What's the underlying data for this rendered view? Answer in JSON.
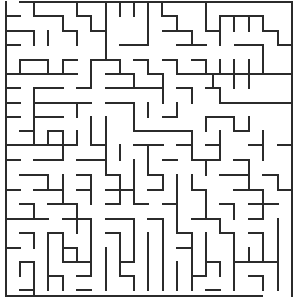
{
  "maze": {
    "width": 302,
    "height": 300,
    "wall_color": "#2b2b2b",
    "background": "#ffffff",
    "grid": {
      "cols": 20,
      "rows": 20,
      "origin_x": 6,
      "origin_y": 2,
      "cell": 14.4
    },
    "walls": [
      [
        20,
        2,
        292,
        2
      ],
      [
        6,
        2,
        6,
        296
      ],
      [
        292,
        2,
        292,
        296
      ],
      [
        6,
        296,
        262,
        296
      ],
      [
        6,
        16,
        20,
        16
      ],
      [
        34,
        2,
        34,
        16
      ],
      [
        34,
        16,
        63,
        16
      ],
      [
        63,
        16,
        63,
        31
      ],
      [
        77,
        2,
        77,
        16
      ],
      [
        77,
        16,
        91,
        16
      ],
      [
        91,
        16,
        91,
        31
      ],
      [
        106,
        2,
        106,
        31
      ],
      [
        120,
        2,
        120,
        16
      ],
      [
        134,
        2,
        134,
        16
      ],
      [
        148,
        2,
        148,
        31
      ],
      [
        162,
        2,
        162,
        16
      ],
      [
        163,
        16,
        177,
        16
      ],
      [
        177,
        16,
        177,
        31
      ],
      [
        206,
        2,
        206,
        31
      ],
      [
        220,
        16,
        263,
        16
      ],
      [
        220,
        16,
        220,
        45
      ],
      [
        234,
        16,
        234,
        31
      ],
      [
        249,
        16,
        249,
        31
      ],
      [
        263,
        16,
        263,
        31
      ],
      [
        263,
        31,
        278,
        31
      ],
      [
        278,
        31,
        278,
        45
      ],
      [
        278,
        45,
        292,
        45
      ],
      [
        6,
        31,
        34,
        31
      ],
      [
        34,
        31,
        34,
        45
      ],
      [
        48,
        31,
        48,
        45
      ],
      [
        63,
        31,
        77,
        31
      ],
      [
        77,
        31,
        77,
        45
      ],
      [
        91,
        31,
        106,
        31
      ],
      [
        106,
        31,
        106,
        45
      ],
      [
        148,
        31,
        148,
        45
      ],
      [
        134,
        45,
        148,
        45
      ],
      [
        163,
        31,
        192,
        31
      ],
      [
        192,
        31,
        192,
        45
      ],
      [
        177,
        45,
        206,
        45
      ],
      [
        206,
        31,
        220,
        31
      ],
      [
        235,
        45,
        263,
        45
      ],
      [
        263,
        45,
        263,
        60
      ],
      [
        6,
        45,
        20,
        45
      ],
      [
        106,
        45,
        106,
        60
      ],
      [
        120,
        45,
        134,
        45
      ],
      [
        20,
        60,
        48,
        60
      ],
      [
        20,
        60,
        20,
        74
      ],
      [
        48,
        60,
        48,
        74
      ],
      [
        63,
        60,
        77,
        60
      ],
      [
        63,
        60,
        63,
        74
      ],
      [
        91,
        60,
        120,
        60
      ],
      [
        91,
        60,
        91,
        88
      ],
      [
        120,
        60,
        120,
        74
      ],
      [
        134,
        60,
        148,
        60
      ],
      [
        148,
        60,
        148,
        74
      ],
      [
        163,
        60,
        177,
        60
      ],
      [
        177,
        60,
        177,
        74
      ],
      [
        192,
        60,
        206,
        60
      ],
      [
        206,
        60,
        206,
        74
      ],
      [
        220,
        60,
        220,
        74
      ],
      [
        234,
        60,
        234,
        74
      ],
      [
        249,
        60,
        249,
        74
      ],
      [
        263,
        60,
        263,
        74
      ],
      [
        6,
        74,
        77,
        74
      ],
      [
        106,
        74,
        134,
        74
      ],
      [
        134,
        74,
        134,
        88
      ],
      [
        148,
        74,
        163,
        74
      ],
      [
        163,
        74,
        163,
        88
      ],
      [
        177,
        74,
        292,
        74
      ],
      [
        213,
        74,
        213,
        88
      ],
      [
        234,
        74,
        234,
        88
      ],
      [
        249,
        74,
        249,
        88
      ],
      [
        6,
        88,
        20,
        88
      ],
      [
        34,
        88,
        63,
        88
      ],
      [
        34,
        88,
        34,
        145
      ],
      [
        77,
        88,
        91,
        88
      ],
      [
        106,
        88,
        163,
        88
      ],
      [
        163,
        88,
        163,
        103
      ],
      [
        177,
        88,
        192,
        88
      ],
      [
        192,
        88,
        192,
        103
      ],
      [
        206,
        88,
        220,
        88
      ],
      [
        220,
        88,
        220,
        103
      ],
      [
        6,
        103,
        20,
        103
      ],
      [
        34,
        103,
        91,
        103
      ],
      [
        77,
        103,
        77,
        117
      ],
      [
        106,
        103,
        134,
        103
      ],
      [
        134,
        103,
        134,
        131
      ],
      [
        134,
        131,
        177,
        131
      ],
      [
        148,
        103,
        148,
        117
      ],
      [
        177,
        103,
        177,
        117
      ],
      [
        163,
        117,
        177,
        117
      ],
      [
        220,
        103,
        292,
        103
      ],
      [
        6,
        117,
        20,
        117
      ],
      [
        34,
        117,
        63,
        117
      ],
      [
        91,
        117,
        91,
        145
      ],
      [
        106,
        117,
        106,
        131
      ],
      [
        163,
        131,
        192,
        131
      ],
      [
        206,
        117,
        234,
        117
      ],
      [
        206,
        117,
        206,
        131
      ],
      [
        234,
        117,
        234,
        131
      ],
      [
        249,
        117,
        249,
        131
      ],
      [
        20,
        131,
        34,
        131
      ],
      [
        48,
        131,
        63,
        131
      ],
      [
        48,
        131,
        48,
        145
      ],
      [
        63,
        131,
        63,
        160
      ],
      [
        77,
        131,
        77,
        145
      ],
      [
        106,
        131,
        106,
        145
      ],
      [
        192,
        131,
        192,
        160
      ],
      [
        220,
        131,
        220,
        145
      ],
      [
        234,
        131,
        249,
        131
      ],
      [
        263,
        131,
        263,
        145
      ],
      [
        6,
        145,
        63,
        145
      ],
      [
        63,
        145,
        77,
        145
      ],
      [
        91,
        145,
        106,
        145
      ],
      [
        106,
        145,
        106,
        175
      ],
      [
        120,
        145,
        120,
        160
      ],
      [
        134,
        145,
        163,
        145
      ],
      [
        148,
        145,
        148,
        175
      ],
      [
        177,
        145,
        192,
        145
      ],
      [
        206,
        145,
        220,
        145
      ],
      [
        220,
        145,
        220,
        160
      ],
      [
        249,
        145,
        263,
        145
      ],
      [
        263,
        145,
        263,
        160
      ],
      [
        278,
        145,
        292,
        145
      ],
      [
        6,
        160,
        20,
        160
      ],
      [
        34,
        160,
        63,
        160
      ],
      [
        77,
        160,
        106,
        160
      ],
      [
        134,
        160,
        134,
        190
      ],
      [
        163,
        160,
        177,
        160
      ],
      [
        192,
        160,
        220,
        160
      ],
      [
        206,
        160,
        206,
        175
      ],
      [
        234,
        160,
        249,
        160
      ],
      [
        249,
        160,
        249,
        175
      ],
      [
        20,
        175,
        48,
        175
      ],
      [
        48,
        175,
        48,
        190
      ],
      [
        63,
        175,
        63,
        204
      ],
      [
        77,
        175,
        91,
        175
      ],
      [
        91,
        175,
        91,
        204
      ],
      [
        106,
        175,
        120,
        175
      ],
      [
        120,
        175,
        120,
        204
      ],
      [
        148,
        175,
        163,
        175
      ],
      [
        163,
        175,
        163,
        190
      ],
      [
        177,
        175,
        177,
        204
      ],
      [
        192,
        175,
        192,
        190
      ],
      [
        220,
        175,
        249,
        175
      ],
      [
        249,
        175,
        249,
        190
      ],
      [
        263,
        175,
        278,
        175
      ],
      [
        278,
        175,
        278,
        190
      ],
      [
        6,
        190,
        20,
        190
      ],
      [
        34,
        190,
        63,
        190
      ],
      [
        77,
        190,
        91,
        190
      ],
      [
        106,
        190,
        134,
        190
      ],
      [
        134,
        190,
        134,
        204
      ],
      [
        148,
        190,
        163,
        190
      ],
      [
        192,
        190,
        206,
        190
      ],
      [
        206,
        190,
        206,
        219
      ],
      [
        234,
        190,
        263,
        190
      ],
      [
        263,
        190,
        263,
        219
      ],
      [
        278,
        190,
        292,
        190
      ],
      [
        20,
        204,
        34,
        204
      ],
      [
        34,
        204,
        34,
        219
      ],
      [
        48,
        204,
        77,
        204
      ],
      [
        77,
        204,
        77,
        219
      ],
      [
        106,
        204,
        120,
        204
      ],
      [
        134,
        204,
        148,
        204
      ],
      [
        163,
        204,
        177,
        204
      ],
      [
        177,
        204,
        177,
        233
      ],
      [
        220,
        204,
        234,
        204
      ],
      [
        234,
        204,
        234,
        219
      ],
      [
        249,
        204,
        278,
        204
      ],
      [
        6,
        219,
        48,
        219
      ],
      [
        63,
        219,
        91,
        219
      ],
      [
        77,
        219,
        77,
        233
      ],
      [
        91,
        219,
        91,
        248
      ],
      [
        106,
        219,
        134,
        219
      ],
      [
        134,
        219,
        134,
        262
      ],
      [
        148,
        219,
        163,
        219
      ],
      [
        163,
        219,
        163,
        290
      ],
      [
        192,
        219,
        220,
        219
      ],
      [
        220,
        219,
        220,
        233
      ],
      [
        249,
        219,
        263,
        219
      ],
      [
        278,
        219,
        278,
        290
      ],
      [
        20,
        233,
        34,
        233
      ],
      [
        34,
        233,
        34,
        248
      ],
      [
        48,
        233,
        63,
        233
      ],
      [
        48,
        233,
        48,
        290
      ],
      [
        63,
        233,
        63,
        262
      ],
      [
        106,
        233,
        120,
        233
      ],
      [
        120,
        233,
        120,
        276
      ],
      [
        148,
        233,
        148,
        290
      ],
      [
        177,
        233,
        192,
        233
      ],
      [
        192,
        233,
        192,
        248
      ],
      [
        206,
        233,
        206,
        276
      ],
      [
        220,
        233,
        234,
        233
      ],
      [
        234,
        233,
        234,
        290
      ],
      [
        249,
        233,
        263,
        233
      ],
      [
        263,
        233,
        263,
        262
      ],
      [
        6,
        248,
        20,
        248
      ],
      [
        63,
        248,
        77,
        248
      ],
      [
        77,
        248,
        77,
        262
      ],
      [
        91,
        248,
        91,
        276
      ],
      [
        106,
        248,
        106,
        290
      ],
      [
        177,
        248,
        192,
        248
      ],
      [
        192,
        248,
        192,
        290
      ],
      [
        249,
        248,
        249,
        262
      ],
      [
        249,
        262,
        278,
        262
      ],
      [
        20,
        262,
        34,
        262
      ],
      [
        20,
        262,
        20,
        276
      ],
      [
        34,
        262,
        34,
        296
      ],
      [
        63,
        262,
        91,
        262
      ],
      [
        120,
        262,
        134,
        262
      ],
      [
        177,
        262,
        177,
        290
      ],
      [
        206,
        262,
        220,
        262
      ],
      [
        220,
        262,
        220,
        276
      ],
      [
        234,
        262,
        249,
        262
      ],
      [
        48,
        276,
        63,
        276
      ],
      [
        63,
        276,
        63,
        290
      ],
      [
        77,
        276,
        91,
        276
      ],
      [
        120,
        276,
        134,
        276
      ],
      [
        134,
        276,
        134,
        290
      ],
      [
        192,
        276,
        206,
        276
      ],
      [
        249,
        276,
        263,
        276
      ],
      [
        263,
        276,
        263,
        290
      ],
      [
        20,
        290,
        34,
        290
      ],
      [
        77,
        290,
        91,
        290
      ],
      [
        206,
        290,
        220,
        290
      ]
    ]
  }
}
